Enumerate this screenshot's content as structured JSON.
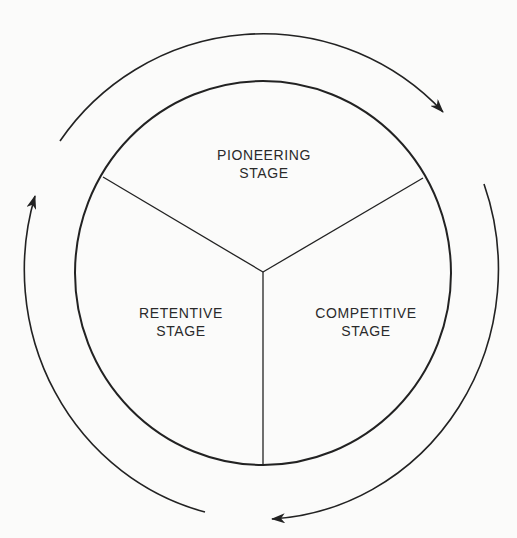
{
  "diagram": {
    "type": "cycle",
    "center": "shared vertex of three segments",
    "segments": [
      {
        "id": "pioneering",
        "line1": "PIONEERING",
        "line2": "STAGE",
        "position": "top"
      },
      {
        "id": "competitive",
        "line1": "COMPETITIVE",
        "line2": "STAGE",
        "position": "bottom-right"
      },
      {
        "id": "retentive",
        "line1": "RETENTIVE",
        "line2": "STAGE",
        "position": "bottom-left"
      }
    ],
    "flow": "clockwise",
    "arrows": [
      {
        "from": "pioneering",
        "to": "competitive",
        "label": ""
      },
      {
        "from": "competitive",
        "to": "retentive",
        "label": ""
      },
      {
        "from": "retentive",
        "to": "pioneering",
        "label": ""
      }
    ],
    "colors": {
      "stroke": "#222222",
      "text": "#2a2a2a",
      "background": "#fbfbfa"
    }
  }
}
